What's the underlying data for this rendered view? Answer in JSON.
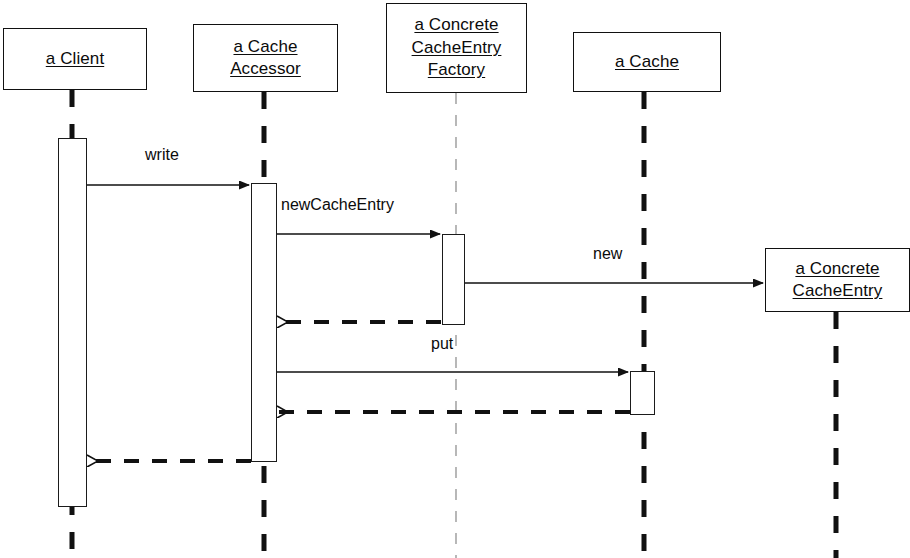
{
  "diagram": {
    "kind": "uml-sequence-diagram",
    "colors": {
      "stroke": "#111111",
      "background": "#ffffff",
      "faint_lifeline": "#9a9a9a"
    },
    "participants": [
      {
        "id": "client",
        "lines": [
          "a Client"
        ],
        "box": {
          "x": 3,
          "y": 28,
          "w": 144,
          "h": 62
        },
        "lifeline_x": 72,
        "lifeline_style": "thick-dashed"
      },
      {
        "id": "cache-accessor",
        "lines": [
          "a Cache",
          "Accessor"
        ],
        "box": {
          "x": 193,
          "y": 24,
          "w": 145,
          "h": 68
        },
        "lifeline_x": 264,
        "lifeline_style": "thick-dashed"
      },
      {
        "id": "concrete-cacheentry-factory",
        "lines": [
          "a Concrete",
          "CacheEntry",
          "Factory"
        ],
        "box": {
          "x": 386,
          "y": 3,
          "w": 141,
          "h": 90
        },
        "lifeline_x": 456,
        "lifeline_style": "thin-dashed"
      },
      {
        "id": "cache",
        "lines": [
          "a Cache"
        ],
        "box": {
          "x": 573,
          "y": 32,
          "w": 148,
          "h": 60
        },
        "lifeline_x": 644,
        "lifeline_style": "thick-dashed"
      },
      {
        "id": "concrete-cacheentry",
        "lines": [
          "a Concrete",
          "CacheEntry"
        ],
        "box": {
          "x": 765,
          "y": 248,
          "w": 145,
          "h": 64
        },
        "lifeline_x": 836,
        "lifeline_style": "thick-dashed"
      }
    ],
    "activations": [
      {
        "id": "client-activation",
        "x": 58,
        "y": 138,
        "w": 29,
        "h": 369
      },
      {
        "id": "cache-accessor-activation",
        "x": 251,
        "y": 183,
        "w": 26,
        "h": 279
      },
      {
        "id": "factory-activation",
        "x": 442,
        "y": 234,
        "w": 23,
        "h": 91
      },
      {
        "id": "cache-activation",
        "x": 630,
        "y": 371,
        "w": 25,
        "h": 44
      }
    ],
    "messages": [
      {
        "id": "write",
        "label": "write",
        "kind": "call",
        "from": "client",
        "to": "cache-accessor",
        "x1": 87,
        "x2": 249,
        "y": 185,
        "label_x": 145,
        "label_y": 146
      },
      {
        "id": "newCacheEntry",
        "label": "newCacheEntry",
        "kind": "call",
        "from": "cache-accessor",
        "to": "concrete-cacheentry-factory",
        "x1": 277,
        "x2": 440,
        "y": 234,
        "label_x": 281,
        "label_y": 196
      },
      {
        "id": "new",
        "label": "new",
        "kind": "call",
        "from": "concrete-cacheentry-factory",
        "to": "concrete-cacheentry",
        "x1": 465,
        "x2": 763,
        "y": 283,
        "label_x": 593,
        "label_y": 245
      },
      {
        "id": "newCacheEntry-return",
        "label": "",
        "kind": "return",
        "from": "concrete-cacheentry-factory",
        "to": "cache-accessor",
        "x1": 441,
        "x2": 277,
        "y": 322,
        "label_x": 0,
        "label_y": 0
      },
      {
        "id": "put",
        "label": "put",
        "kind": "call",
        "from": "cache-accessor",
        "to": "cache",
        "x1": 277,
        "x2": 628,
        "y": 372,
        "label_x": 431,
        "label_y": 335
      },
      {
        "id": "put-return",
        "label": "",
        "kind": "return",
        "from": "cache",
        "to": "cache-accessor",
        "x1": 630,
        "x2": 277,
        "y": 412,
        "label_x": 0,
        "label_y": 0
      },
      {
        "id": "write-return",
        "label": "",
        "kind": "return",
        "from": "cache-accessor",
        "to": "client",
        "x1": 251,
        "x2": 87,
        "y": 461,
        "label_x": 0,
        "label_y": 0
      }
    ]
  }
}
